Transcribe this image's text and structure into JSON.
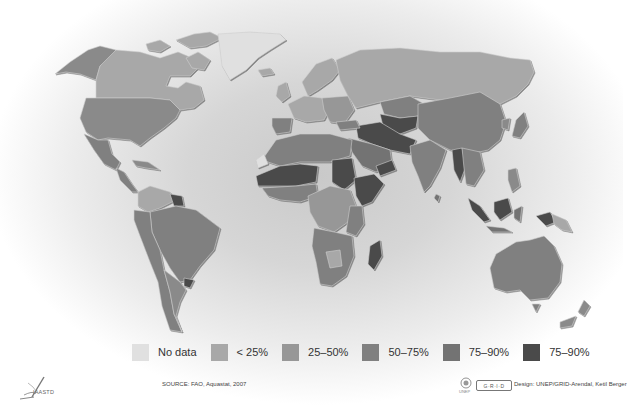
{
  "map": {
    "type": "choropleth",
    "projection": "world",
    "color_scheme": "grayscale",
    "regions_visible": [
      "North America",
      "Greenland",
      "Central America",
      "South America",
      "Europe",
      "Africa",
      "Middle East",
      "Russia",
      "Central Asia",
      "South Asia",
      "East Asia",
      "Southeast Asia",
      "Australia",
      "New Zealand"
    ]
  },
  "legend": {
    "items": [
      {
        "label": "No data",
        "color": "#e0e0e0"
      },
      {
        "label": "< 25%",
        "color": "#a8a8a8"
      },
      {
        "label": "25–50%",
        "color": "#979797"
      },
      {
        "label": "50–75%",
        "color": "#808080"
      },
      {
        "label": "75–90%",
        "color": "#737373"
      },
      {
        "label": "75–90%",
        "color": "#4a4a4a"
      }
    ]
  },
  "footer": {
    "left_logo": "IAASTD",
    "source": "SOURCE: FAO, Aquastat, 2007",
    "grid_logo": "G·R·I·D",
    "unep_label": "UNEP",
    "design": "Design: UNEP/GRID-Arendal, Ketil Berger"
  },
  "colors": {
    "no_data": "#e0e0e0",
    "lt25": "#a8a8a8",
    "p25_50": "#979797",
    "p50_75": "#808080",
    "p75_90": "#737373",
    "p90": "#4a4a4a"
  }
}
